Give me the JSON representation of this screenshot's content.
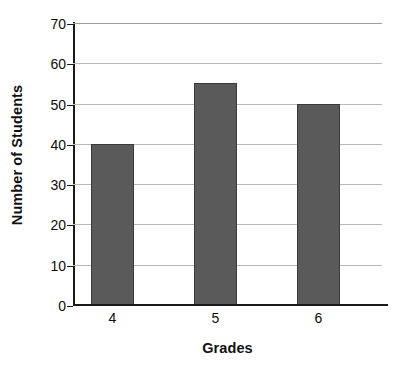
{
  "chart_data": {
    "type": "bar",
    "title": "",
    "categories": [
      "4",
      "5",
      "6"
    ],
    "values": [
      40,
      55,
      50
    ],
    "series": [
      {
        "name": "Number of Students",
        "values": [
          40,
          55,
          50
        ]
      }
    ],
    "xlabel": "Grades",
    "ylabel": "Number of Students",
    "ylim": [
      0,
      70
    ],
    "ytick_step": 10,
    "yticks": [
      0,
      10,
      20,
      30,
      40,
      50,
      60,
      70
    ],
    "ytick_labels": [
      "0",
      "10",
      "20",
      "30",
      "40",
      "50",
      "60",
      "70"
    ],
    "xtick_labels": [
      "4",
      "5",
      "6"
    ],
    "grid": true,
    "grid_axis": "y",
    "legend": false,
    "legend_position": "none",
    "bar_color": "#5a5a5a",
    "bar_edge_color": "#3a3a3a",
    "grid_color": "#b9b9b9",
    "axis_color": "#1a1a1a",
    "background_color": "#ffffff",
    "text_color": "#0d0d0d"
  }
}
